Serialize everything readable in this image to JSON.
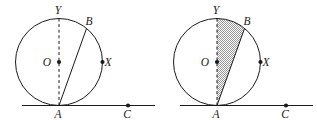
{
  "figure": {
    "type": "geometry-diagram-pair",
    "background_color": "#ffffff",
    "stroke_color": "#1a1a1a",
    "shade_color": "#9a9a9a",
    "panels": [
      {
        "id": "left",
        "name": "unshaded-circle-diagram",
        "shaded": false,
        "shade_label": "",
        "circle": {
          "cx": 59,
          "cy": 62,
          "r": 43.5
        },
        "points": [
          {
            "label": "Y",
            "name": "point-y",
            "x": 59,
            "y": 18.5,
            "label_dx": -1,
            "label_dy": -4.5,
            "marker": false
          },
          {
            "label": "B",
            "name": "point-b",
            "x": 86.5,
            "y": 28.5,
            "label_dx": 2.5,
            "label_dy": -4.0,
            "marker": false
          },
          {
            "label": "O",
            "name": "point-o-center",
            "x": 59,
            "y": 62,
            "label_dx": -12.0,
            "label_dy": 3.5,
            "marker": true
          },
          {
            "label": "X",
            "name": "point-x",
            "x": 102.5,
            "y": 62,
            "label_dx": 5.5,
            "label_dy": 3.5,
            "marker": true
          },
          {
            "label": "A",
            "name": "point-a",
            "x": 59,
            "y": 105.5,
            "label_dx": -1,
            "label_dy": 12.5,
            "marker": false
          },
          {
            "label": "C",
            "name": "point-c",
            "x": 128,
            "y": 105.5,
            "label_dx": -1,
            "label_dy": 12.5,
            "marker": true
          }
        ],
        "segments": [
          {
            "name": "chord-ab",
            "x1": 59,
            "y1": 105.5,
            "x2": 86.5,
            "y2": 28.5,
            "style": "solid"
          },
          {
            "name": "diameter-ya",
            "x1": 59,
            "y1": 18.5,
            "x2": 59,
            "y2": 105.5,
            "style": "dashed"
          },
          {
            "name": "tangent-line-at-a",
            "x1": 22,
            "y1": 105.5,
            "x2": 155,
            "y2": 105.5,
            "style": "solid"
          }
        ]
      },
      {
        "id": "right",
        "name": "shaded-circle-diagram",
        "shaded": true,
        "shade_label": "shaded-segment-yab",
        "circle": {
          "cx": 217,
          "cy": 62,
          "r": 43.5
        },
        "points": [
          {
            "label": "Y",
            "name": "point-y",
            "x": 217,
            "y": 18.5,
            "label_dx": -1,
            "label_dy": -4.5,
            "marker": false
          },
          {
            "label": "B",
            "name": "point-b",
            "x": 244.5,
            "y": 28.5,
            "label_dx": 2.5,
            "label_dy": -4.0,
            "marker": false
          },
          {
            "label": "O",
            "name": "point-o-center",
            "x": 217,
            "y": 62,
            "label_dx": -12.0,
            "label_dy": 3.5,
            "marker": true
          },
          {
            "label": "X",
            "name": "point-x",
            "x": 260.5,
            "y": 62,
            "label_dx": 5.5,
            "label_dy": 3.5,
            "marker": true
          },
          {
            "label": "A",
            "name": "point-a",
            "x": 217,
            "y": 105.5,
            "label_dx": -1,
            "label_dy": 12.5,
            "marker": false
          },
          {
            "label": "C",
            "name": "point-c",
            "x": 286,
            "y": 105.5,
            "label_dx": -1,
            "label_dy": 12.5,
            "marker": true
          }
        ],
        "segments": [
          {
            "name": "chord-ab",
            "x1": 217,
            "y1": 105.5,
            "x2": 244.5,
            "y2": 28.5,
            "style": "solid"
          },
          {
            "name": "diameter-ya",
            "x1": 217,
            "y1": 18.5,
            "x2": 217,
            "y2": 105.5,
            "style": "dashed"
          },
          {
            "name": "tangent-line-at-a",
            "x1": 180,
            "y1": 105.5,
            "x2": 313,
            "y2": 105.5,
            "style": "solid"
          }
        ]
      }
    ]
  }
}
